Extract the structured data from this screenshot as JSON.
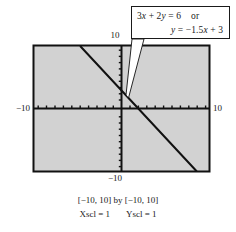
{
  "figure": {
    "type": "graphing-calculator-window",
    "callout": {
      "equation_line_1_lhs": "3x + 2y = 6",
      "equation_line_1_connector": "or",
      "equation_line_2": "y = −1.5x + 3"
    },
    "axis_labels": {
      "top": "10",
      "bottom": "−10",
      "left": "−10",
      "right": "10"
    },
    "caption": {
      "window": "[−10, 10] by [−10, 10]",
      "xscl": "Xscl = 1",
      "yscl": "Yscl = 1"
    },
    "colors": {
      "plot_background": "#d2d2d2",
      "frame": "#111111",
      "axis": "#111111",
      "curve": "#111111",
      "callout_fill": "#ffffff",
      "page_background": "#ffffff"
    }
  },
  "chart_data": {
    "type": "line",
    "title": "",
    "subtitle": "",
    "xlabel": "x",
    "ylabel": "y",
    "xlim": [
      -10,
      10
    ],
    "ylim": [
      -10,
      10
    ],
    "xscl": 1,
    "yscl": 1,
    "grid": false,
    "legend": "none",
    "annotations": [
      "3x + 2y = 6   or",
      "y = −1.5x + 3"
    ],
    "tick_labels": {
      "x": [
        -10,
        10
      ],
      "y": [
        -10,
        10
      ]
    },
    "series": [
      {
        "name": "y = -1.5x + 3",
        "equation_standard": "3x + 2y = 6",
        "equation_slope_intercept": "y = -1.5x + 3",
        "slope": -1.5,
        "y_intercept": 3,
        "x_intercept": 2,
        "x": [
          -4.667,
          -4,
          -3,
          -2,
          -1,
          0,
          1,
          2,
          3,
          4,
          5,
          6,
          7,
          8,
          8.667
        ],
        "values": [
          10,
          9,
          7.5,
          6,
          4.5,
          3,
          1.5,
          0,
          -1.5,
          -3,
          -4.5,
          -6,
          -7.5,
          -9,
          -10
        ]
      }
    ]
  }
}
